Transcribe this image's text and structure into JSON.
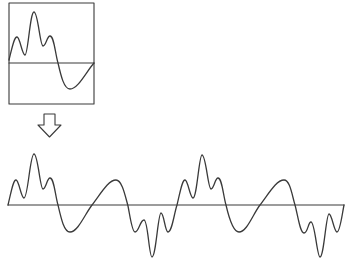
{
  "diagram": {
    "description": "One period of a complex periodic waveform (boxed) is repeated to form the full signal",
    "colors": {
      "stroke": "#3a3a3a",
      "background": "#ffffff"
    },
    "single_period": {
      "label": "single period waveform",
      "box": {
        "x": 9,
        "y": 3,
        "width": 85,
        "height": 101
      },
      "baseline_y": 63,
      "points": [
        [
          9,
          60
        ],
        [
          17,
          37
        ],
        [
          25,
          55
        ],
        [
          34,
          12
        ],
        [
          43,
          46
        ],
        [
          50,
          36
        ],
        [
          58,
          63
        ],
        [
          70,
          89
        ],
        [
          94,
          63
        ]
      ]
    },
    "arrow": {
      "label": "repeats into",
      "direction": "down",
      "icon": "hollow-down-arrow-icon"
    },
    "repeated_signal": {
      "label": "repeated periodic waveform",
      "baseline": {
        "x1": 8,
        "x2": 344,
        "y": 205
      },
      "periods": 4,
      "points": [
        [
          8,
          205
        ],
        [
          16,
          180
        ],
        [
          24,
          198
        ],
        [
          34,
          154
        ],
        [
          43,
          189
        ],
        [
          50,
          178
        ],
        [
          58,
          205
        ],
        [
          70,
          232
        ],
        [
          92,
          205
        ],
        [
          116,
          180
        ],
        [
          128,
          206
        ],
        [
          135,
          232
        ],
        [
          144,
          220
        ],
        [
          152,
          257
        ],
        [
          161,
          213
        ],
        [
          168,
          232
        ],
        [
          177,
          205
        ],
        [
          185,
          180
        ],
        [
          193,
          198
        ],
        [
          202,
          155
        ],
        [
          211,
          189
        ],
        [
          218,
          178
        ],
        [
          226,
          205
        ],
        [
          239,
          232
        ],
        [
          260,
          205
        ],
        [
          284,
          180
        ],
        [
          295,
          205
        ],
        [
          304,
          233
        ],
        [
          311,
          222
        ],
        [
          320,
          257
        ],
        [
          329,
          214
        ],
        [
          337,
          232
        ],
        [
          344,
          205
        ]
      ]
    }
  }
}
